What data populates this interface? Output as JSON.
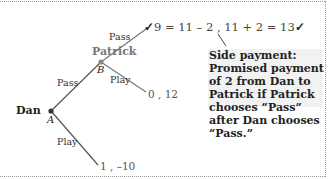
{
  "colors": {
    "edge": "#555555",
    "node": "#444444",
    "patrick_label": "#777777",
    "dan_label": "#222222",
    "note_bg": "#f2f2f2",
    "border": "#9a9a9a"
  },
  "players": {
    "dan": {
      "name": "Dan",
      "node": "A"
    },
    "patrick": {
      "name": "Patrick",
      "node": "B"
    }
  },
  "branches": {
    "dan_pass": "Pass",
    "dan_play": "Play",
    "patrick_pass": "Pass",
    "patrick_play": "Play"
  },
  "payoffs": {
    "pass_pass": {
      "check_left": "✓",
      "expression": "9 = 11 – 2 , 11 + 2 = 13",
      "check_right": "✓"
    },
    "pass_play": "0 , 12",
    "play": "1 , –10"
  },
  "annotation": {
    "text": "Side payment: Promised payment of 2 from Dan to Patrick if Patrick chooses “Pass” after Dan chooses “Pass.”"
  }
}
